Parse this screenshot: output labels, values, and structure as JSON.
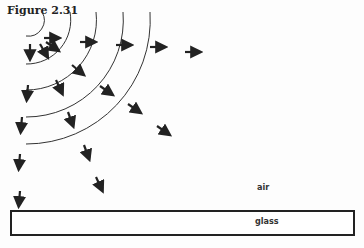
{
  "figure": {
    "title": "Figure 2.31",
    "labels": {
      "air": "air",
      "glass": "glass"
    },
    "center": [
      26,
      20
    ],
    "wavefront_radii": [
      16,
      44,
      70,
      97,
      124
    ],
    "arrows": [
      {
        "x": 44,
        "y": 38,
        "angle": 0
      },
      {
        "x": 30,
        "y": 44,
        "angle": 90
      },
      {
        "x": 40,
        "y": 44,
        "angle": 60
      },
      {
        "x": 46,
        "y": 42,
        "angle": 35
      },
      {
        "x": 80,
        "y": 42,
        "angle": 0
      },
      {
        "x": 116,
        "y": 45,
        "angle": 0
      },
      {
        "x": 150,
        "y": 47,
        "angle": 0
      },
      {
        "x": 185,
        "y": 52,
        "angle": 0
      },
      {
        "x": 72,
        "y": 65,
        "angle": 40
      },
      {
        "x": 28,
        "y": 85,
        "angle": 95
      },
      {
        "x": 56,
        "y": 80,
        "angle": 65
      },
      {
        "x": 100,
        "y": 86,
        "angle": 35
      },
      {
        "x": 128,
        "y": 104,
        "angle": 35
      },
      {
        "x": 157,
        "y": 126,
        "angle": 35
      },
      {
        "x": 22,
        "y": 117,
        "angle": 95
      },
      {
        "x": 68,
        "y": 112,
        "angle": 70
      },
      {
        "x": 20,
        "y": 154,
        "angle": 95
      },
      {
        "x": 84,
        "y": 145,
        "angle": 70
      },
      {
        "x": 96,
        "y": 177,
        "angle": 65
      },
      {
        "x": 20,
        "y": 191,
        "angle": 95
      }
    ]
  }
}
